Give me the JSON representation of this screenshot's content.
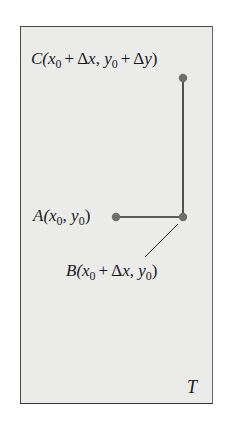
{
  "diagram": {
    "region_label": "T",
    "colors": {
      "region_fill": "#ebebea",
      "region_border": "#4a4a4a",
      "point_fill": "#6e6e6e",
      "line": "#2a2a2a"
    },
    "points": [
      {
        "id": "A",
        "name": "A",
        "coords": [
          "x",
          "0",
          "y",
          "0"
        ],
        "label": "A(x0, y0)",
        "parts": {
          "open": "A(",
          "x": "x",
          "xs": "0",
          "sep": ", ",
          "y": "y",
          "ys": "0",
          "close": ")"
        }
      },
      {
        "id": "B",
        "name": "B",
        "label": "B(x0 + Δx, y0)",
        "parts": {
          "open": "B(",
          "x": "x",
          "xs": "0",
          "plus": "+",
          "dx": "Δx",
          "sep": ", ",
          "y": "y",
          "ys": "0",
          "close": ")"
        }
      },
      {
        "id": "C",
        "name": "C",
        "label": "C(x0 + Δx, y0 + Δy)",
        "parts": {
          "open": "C(",
          "x": "x",
          "xs": "0",
          "plus1": "+",
          "dx": "Δx",
          "sep": ", ",
          "y": "y",
          "ys": "0",
          "plus2": "+",
          "dy": "Δy",
          "close": ")"
        }
      }
    ],
    "segments": [
      {
        "from": "A",
        "to": "B",
        "direction": "horizontal"
      },
      {
        "from": "B",
        "to": "C",
        "direction": "vertical"
      }
    ]
  }
}
